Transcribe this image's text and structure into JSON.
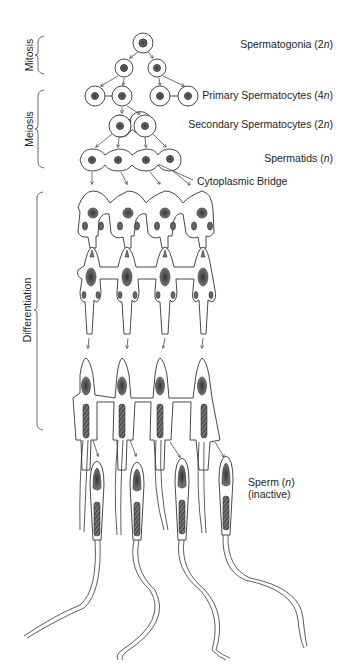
{
  "diagram": {
    "stages": [
      {
        "id": "mitosis",
        "label": "Mitosis"
      },
      {
        "id": "meiosis",
        "label": "Meiosis"
      },
      {
        "id": "differentiation",
        "label": "Differentiation"
      }
    ],
    "cell_labels": {
      "spermatogonia": {
        "name": "Spermatogonia",
        "ploidy": "2n",
        "text": "Spermatogonia (2",
        "n": "n",
        "close": ")"
      },
      "primary": {
        "name": "Primary Spermatocytes",
        "ploidy": "4n",
        "text": "Primary Spermatocytes (4",
        "n": "n",
        "close": ")"
      },
      "secondary": {
        "name": "Secondary Spermatocytes",
        "ploidy": "2n",
        "text": "Secondary Spermatocytes (2",
        "n": "n",
        "close": ")"
      },
      "spermatids": {
        "name": "Spermatids",
        "ploidy": "n",
        "text": "Spermatids (",
        "n": "n",
        "close": ")"
      },
      "bridge": {
        "text": "Cytoplasmic Bridge"
      },
      "sperm": {
        "name": "Sperm",
        "ploidy": "n",
        "text": "Sperm (",
        "n": "n",
        "close": ")",
        "note": "(inactive)"
      }
    },
    "colors": {
      "line": "#333333",
      "nucleus": "#555555",
      "background": "#ffffff"
    }
  }
}
